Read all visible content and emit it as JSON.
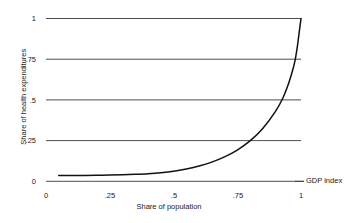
{
  "chart_data": {
    "type": "line",
    "title": "",
    "subtitle": "",
    "xlabel": "Share of population",
    "ylabel": "Share of health expenditures",
    "xlim": [
      0,
      1
    ],
    "ylim": [
      0,
      1
    ],
    "grid": "horizontal",
    "legend": "none",
    "xticks": [
      "0",
      ".25",
      ".5",
      ".75",
      "1"
    ],
    "xtick_values": [
      0,
      0.25,
      0.5,
      0.75,
      1
    ],
    "yticks": [
      "0",
      ".25",
      ".5",
      ".75",
      "1"
    ],
    "ytick_values": [
      0,
      0.25,
      0.5,
      0.75,
      1
    ],
    "annotations": [
      {
        "text": "GDP index",
        "x": 1.0,
        "y": 0.0,
        "position": "right-of-axis"
      }
    ],
    "series": [
      {
        "name": "Concentration curve",
        "color": "#111111",
        "x": [
          0.05,
          0.1,
          0.15,
          0.2,
          0.25,
          0.3,
          0.35,
          0.4,
          0.45,
          0.5,
          0.55,
          0.6,
          0.65,
          0.7,
          0.75,
          0.8,
          0.85,
          0.9,
          0.93,
          0.95,
          0.965,
          0.975,
          0.985,
          0.99,
          1.0
        ],
        "y": [
          0.035,
          0.035,
          0.036,
          0.037,
          0.038,
          0.04,
          0.043,
          0.047,
          0.053,
          0.062,
          0.076,
          0.094,
          0.118,
          0.15,
          0.192,
          0.248,
          0.325,
          0.43,
          0.515,
          0.595,
          0.67,
          0.73,
          0.82,
          0.88,
          1.0
        ]
      }
    ]
  },
  "axes": {
    "y_title": "Share of health expenditures",
    "x_title": "Share of population",
    "gdp_index_label": "GDP index",
    "y_tick_labels": [
      "1",
      ".75",
      ".5",
      ".25",
      "0"
    ],
    "x_tick_labels": [
      "0",
      ".25",
      ".5",
      ".75",
      "1"
    ]
  },
  "colors": {
    "curve": "#111111",
    "gridline": "#3a3a3a",
    "background": "#ffffff",
    "text": "#1a1a1a"
  }
}
